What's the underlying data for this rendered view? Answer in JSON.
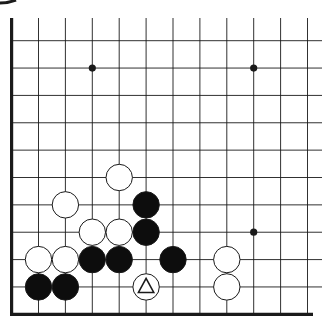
{
  "diagram": {
    "type": "go-board-fragment",
    "columns": 12,
    "rows": 11,
    "edges": [
      "left",
      "bottom"
    ],
    "colors": {
      "background": "#ffffff",
      "line": "#1a1a1a",
      "black_stone": "#0d0d0d",
      "white_stone": "#ffffff",
      "stone_outline": "#1a1a1a",
      "marker": "#1a1a1a"
    },
    "star_points": [
      {
        "col": 3,
        "row": 1
      },
      {
        "col": 9,
        "row": 1
      },
      {
        "col": 9,
        "row": 7
      }
    ],
    "stones": [
      {
        "color": "white",
        "col": 4,
        "row": 5
      },
      {
        "color": "white",
        "col": 2,
        "row": 6
      },
      {
        "color": "black",
        "col": 5,
        "row": 6
      },
      {
        "color": "white",
        "col": 3,
        "row": 7
      },
      {
        "color": "white",
        "col": 4,
        "row": 7
      },
      {
        "color": "black",
        "col": 5,
        "row": 7
      },
      {
        "color": "white",
        "col": 1,
        "row": 8
      },
      {
        "color": "white",
        "col": 2,
        "row": 8
      },
      {
        "color": "black",
        "col": 3,
        "row": 8
      },
      {
        "color": "black",
        "col": 4,
        "row": 8
      },
      {
        "color": "black",
        "col": 6,
        "row": 8
      },
      {
        "color": "white",
        "col": 8,
        "row": 8
      },
      {
        "color": "black",
        "col": 1,
        "row": 9
      },
      {
        "color": "black",
        "col": 2,
        "row": 9
      },
      {
        "color": "white",
        "col": 5,
        "row": 9,
        "marker": "triangle"
      },
      {
        "color": "white",
        "col": 8,
        "row": 9
      }
    ]
  }
}
